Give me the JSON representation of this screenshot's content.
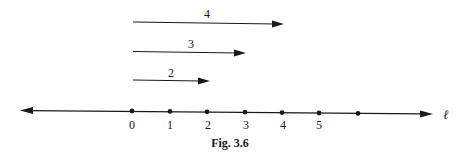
{
  "figure": {
    "caption": "Fig. 3.6",
    "line_label": "ℓ",
    "number_line": {
      "tick_labels": [
        "0",
        "1",
        "2",
        "3",
        "4",
        "5",
        ""
      ],
      "tick_x": [
        132,
        170,
        207,
        245,
        282,
        319,
        358
      ],
      "tick_y": [
        111,
        111.5,
        112,
        112.3,
        112.6,
        113,
        113.4
      ],
      "x_start": 20,
      "y_start": 110.5,
      "x_end": 432,
      "y_end": 114
    },
    "arrows": [
      {
        "label": "4",
        "from": 0,
        "to": 4,
        "y": 23
      },
      {
        "label": "3",
        "from": 0,
        "to": 3,
        "y": 52
      },
      {
        "label": "2",
        "from": 0,
        "to": 2,
        "y": 80
      }
    ],
    "colors": {
      "ink": "#1a1a1a",
      "background": "#ffffff"
    }
  }
}
